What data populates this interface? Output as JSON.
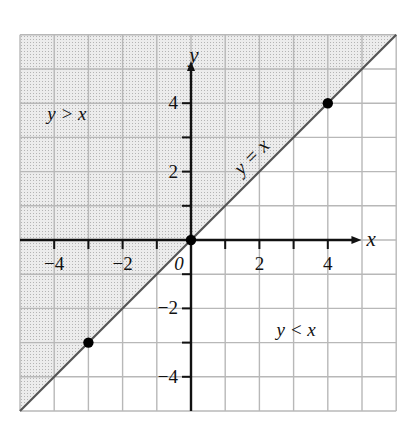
{
  "chart_data": {
    "type": "line",
    "title": "",
    "xlabel": "x",
    "ylabel": "y",
    "origin_label": "0",
    "xlim": [
      -5,
      6
    ],
    "ylim": [
      -5,
      6
    ],
    "grid": true,
    "grid_step": 1,
    "x_tick_labels": [
      {
        "value": -4,
        "label": "−4"
      },
      {
        "value": -2,
        "label": "−2"
      },
      {
        "value": 2,
        "label": "2"
      },
      {
        "value": 4,
        "label": "4"
      }
    ],
    "y_tick_labels": [
      {
        "value": 4,
        "label": "4"
      },
      {
        "value": 2,
        "label": "2"
      },
      {
        "value": -2,
        "label": "−2"
      },
      {
        "value": -4,
        "label": "−4"
      }
    ],
    "series": [
      {
        "name": "y = x",
        "x": [
          -5,
          6
        ],
        "y": [
          -5,
          6
        ],
        "label_position": [
          1.9,
          2.3
        ],
        "label_rotation_deg": -45
      }
    ],
    "points": [
      {
        "x": -3,
        "y": -3
      },
      {
        "x": 0,
        "y": 0
      },
      {
        "x": 4,
        "y": 4
      }
    ],
    "regions": [
      {
        "name": "y > x",
        "shaded": true,
        "label_position": [
          -4.2,
          3.5
        ]
      },
      {
        "name": "y < x",
        "shaded": false,
        "label_position": [
          2.5,
          -2.8
        ]
      }
    ],
    "colors": {
      "shade": "#e4e4e4",
      "grid": "#b8b8b8",
      "axis": "#111111",
      "line": "#555555",
      "point": "#000000"
    }
  }
}
